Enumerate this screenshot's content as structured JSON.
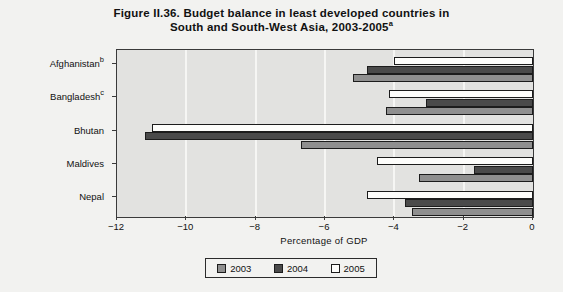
{
  "title": {
    "line1": "Figure II.36. Budget balance in least developed countries in",
    "line2": "South and South-West Asia, 2003-2005",
    "line2_sup": "a"
  },
  "axis": {
    "xlabel": "Percentage of GDP",
    "xticks": [
      "−12",
      "−10",
      "−8",
      "−6",
      "−4",
      "−2",
      "0"
    ]
  },
  "legend": {
    "items": [
      {
        "label": "2003",
        "color": "#8f8f8f"
      },
      {
        "label": "2004",
        "color": "#4a4a4a"
      },
      {
        "label": "2005",
        "color": "#fdfdfb"
      }
    ]
  },
  "countries": [
    {
      "name": "Afghanistan",
      "sup": "b"
    },
    {
      "name": "Bangladesh",
      "sup": "c"
    },
    {
      "name": "Bhutan",
      "sup": ""
    },
    {
      "name": "Maldives",
      "sup": ""
    },
    {
      "name": "Nepal",
      "sup": ""
    }
  ],
  "chart_data": {
    "type": "bar",
    "orientation": "horizontal",
    "title": "Figure II.36. Budget balance in least developed countries in South and South-West Asia, 2003-2005a",
    "xlabel": "Percentage of GDP",
    "ylabel": "",
    "xlim": [
      -12,
      0
    ],
    "xticks": [
      -12,
      -10,
      -8,
      -6,
      -4,
      -2,
      0
    ],
    "grid": true,
    "legend_position": "bottom",
    "categories": [
      "Afghanistan",
      "Bangladesh",
      "Bhutan",
      "Maldives",
      "Nepal"
    ],
    "series": [
      {
        "name": "2003",
        "color": "#8f8f8f",
        "values": [
          -5.2,
          -4.25,
          -6.7,
          -3.3,
          -3.5
        ]
      },
      {
        "name": "2004",
        "color": "#4a4a4a",
        "values": [
          -4.8,
          -3.1,
          -11.2,
          -1.7,
          -3.7
        ]
      },
      {
        "name": "2005",
        "color": "#fdfdfb",
        "values": [
          -4.0,
          -4.15,
          -11.0,
          -4.5,
          -4.8
        ]
      }
    ],
    "footnote_markers": {
      "Afghanistan": "b",
      "Bangladesh": "c",
      "title": "a"
    }
  }
}
